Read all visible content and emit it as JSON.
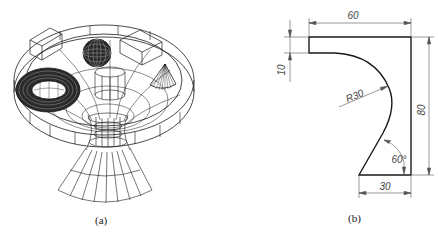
{
  "figure_a": {
    "caption": "(a)",
    "description": "Wireframe 3D model: disc with blocks, sphere, torus, small cone and hyperboloid/cone funnel"
  },
  "figure_b": {
    "caption": "(b)",
    "dimensions": {
      "width_top": "60",
      "thickness_top": "10",
      "height": "80",
      "width_bottom": "30",
      "radius": "R30",
      "angle": "60°"
    }
  },
  "colors": {
    "line": "#1a1a1a",
    "dim_line": "#555555",
    "background": "#ffffff"
  }
}
